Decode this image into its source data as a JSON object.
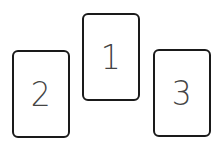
{
  "cards": [
    {
      "id": "card-1",
      "label": "1"
    },
    {
      "id": "card-2",
      "label": "2"
    },
    {
      "id": "card-3",
      "label": "3"
    }
  ],
  "colors": {
    "background": "#ffffff",
    "card_border": "#1a1a1a",
    "card_text": "#444444"
  }
}
